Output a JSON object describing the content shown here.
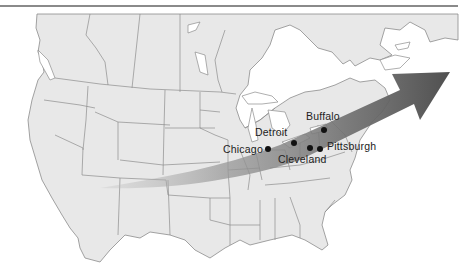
{
  "map": {
    "subject": "Manufacturing belt of North America",
    "colors": {
      "land": "#e8e8e8",
      "border": "#8c8c8c",
      "water": "#ffffff",
      "arrow_light": "#c4c4c4",
      "arrow_dark": "#5a5a5a",
      "dot": "#111111",
      "rule": "#8a8a8a"
    },
    "cities": [
      {
        "name": "Buffalo",
        "label": "Buffalo"
      },
      {
        "name": "Detroit",
        "label": "Detroit"
      },
      {
        "name": "Chicago",
        "label": "Chicago"
      },
      {
        "name": "Cleveland",
        "label": "Cleveland"
      },
      {
        "name": "Pittsburgh",
        "label": "Pittsburgh"
      }
    ],
    "arrow": {
      "direction": "west-to-northeast",
      "icon": "arrow-right-icon"
    }
  }
}
